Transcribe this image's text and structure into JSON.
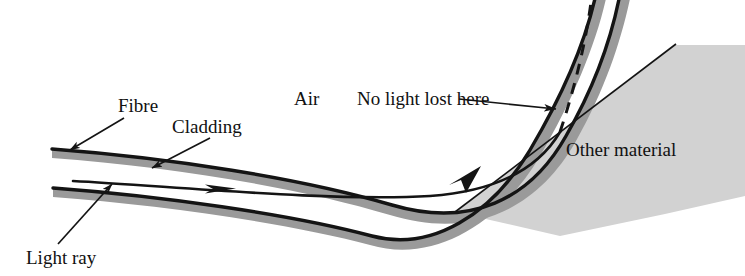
{
  "figure": {
    "type": "physics-diagram",
    "background_color": "#ffffff"
  },
  "labels": {
    "fibre": "Fibre",
    "cladding": "Cladding",
    "air": "Air",
    "no_light_lost": "No light lost here",
    "other_material": "Other material",
    "light_ray": "Light ray"
  },
  "colors": {
    "cladding_grey": "#9a9a9a",
    "other_material_grey": "#d2d2d2",
    "line_black": "#141414",
    "text": "#111111"
  },
  "geometry": {
    "fibre_outer_wall": "M52,149 C170,158 300,178 392,205 C470,228 530,200 566,136 C596,84 612,36 620,-6",
    "fibre_inner_wall": "M53,188 C160,196 290,214 372,236 C432,252 492,214 530,150 C562,96 586,40 596,-6",
    "light_ray_incoming": "M73,181 C170,186 330,202 430,196 C500,191 540,166 560,132",
    "dashed_escape": "M560,132 C572,96 586,46 592,-6",
    "reflection_point": [
      560,
      132
    ],
    "arrow_ray_1": [
      232,
      189
    ],
    "arrow_ray_2": [
      478,
      170
    ],
    "wedge_points": "455,212 675,45 745,45 745,196 665,214 560,236"
  },
  "leaders": [
    {
      "name": "fibre-leader",
      "from": [
        124,
        118
      ],
      "to": [
        66,
        152
      ]
    },
    {
      "name": "cladding-leader",
      "from": [
        208,
        138
      ],
      "to": [
        148,
        170
      ]
    },
    {
      "name": "no-light-leader",
      "from": [
        459,
        100
      ],
      "to": [
        556,
        110
      ]
    },
    {
      "name": "light-ray-leader",
      "from": [
        60,
        243
      ],
      "to": [
        110,
        186
      ]
    }
  ]
}
